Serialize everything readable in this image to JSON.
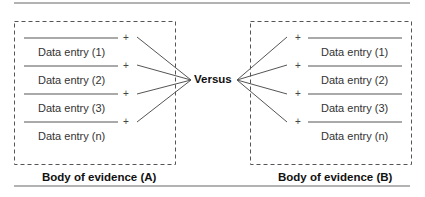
{
  "center_label": "Versus",
  "left": {
    "caption": "Body of evidence (A)",
    "entries": [
      "Data entry (1)",
      "Data entry (2)",
      "Data entry (3)",
      "Data entry (n)"
    ]
  },
  "right": {
    "caption": "Body of evidence (B)",
    "entries": [
      "Data entry (1)",
      "Data entry (2)",
      "Data entry (3)",
      "Data entry (n)"
    ]
  },
  "plus_symbol": "+",
  "colors": {
    "line": "#555555",
    "text": "#333333"
  }
}
